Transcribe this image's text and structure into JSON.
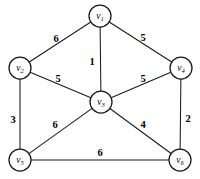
{
  "figure": {
    "background_color": "#ffffff",
    "stroke_color": "#1a1a1a",
    "node_fill_color": "#ffffff",
    "width": 200,
    "height": 179
  },
  "chart_data": {
    "type": "diagram",
    "diagram_type": "weighted-undirected-graph",
    "title": "",
    "xlabel": "",
    "ylabel": "",
    "legend": [],
    "grid": false,
    "node_radius": 11,
    "nodes": [
      {
        "id": "v1",
        "base": "v",
        "subscript": "1",
        "label": "v1",
        "x": 100,
        "y": 16
      },
      {
        "id": "v2",
        "base": "v",
        "subscript": "2",
        "label": "v2",
        "x": 20,
        "y": 68
      },
      {
        "id": "v3",
        "base": "v",
        "subscript": "3",
        "label": "v3",
        "x": 101,
        "y": 102
      },
      {
        "id": "v4",
        "base": "v",
        "subscript": "4",
        "label": "v4",
        "x": 181,
        "y": 68
      },
      {
        "id": "v5",
        "base": "v",
        "subscript": "5",
        "label": "v5",
        "x": 20,
        "y": 160
      },
      {
        "id": "v6",
        "base": "v",
        "subscript": "6",
        "label": "v6",
        "x": 180,
        "y": 160
      }
    ],
    "edges": [
      {
        "source": "v1",
        "target": "v2",
        "weight": 6,
        "label": "6",
        "label_x": 56,
        "label_y": 38
      },
      {
        "source": "v1",
        "target": "v4",
        "weight": 5,
        "label": "5",
        "label_x": 143,
        "label_y": 37
      },
      {
        "source": "v1",
        "target": "v3",
        "weight": 1,
        "label": "1",
        "label_x": 92,
        "label_y": 61
      },
      {
        "source": "v2",
        "target": "v3",
        "weight": 5,
        "label": "5",
        "label_x": 58,
        "label_y": 78
      },
      {
        "source": "v3",
        "target": "v4",
        "weight": 5,
        "label": "5",
        "label_x": 143,
        "label_y": 78
      },
      {
        "source": "v2",
        "target": "v5",
        "weight": 3,
        "label": "3",
        "label_x": 13,
        "label_y": 119
      },
      {
        "source": "v3",
        "target": "v5",
        "weight": 6,
        "label": "6",
        "label_x": 55,
        "label_y": 124
      },
      {
        "source": "v3",
        "target": "v6",
        "weight": 4,
        "label": "4",
        "label_x": 143,
        "label_y": 124
      },
      {
        "source": "v4",
        "target": "v6",
        "weight": 2,
        "label": "2",
        "label_x": 188,
        "label_y": 118
      },
      {
        "source": "v5",
        "target": "v6",
        "weight": 6,
        "label": "6",
        "label_x": 100,
        "label_y": 152
      }
    ]
  }
}
